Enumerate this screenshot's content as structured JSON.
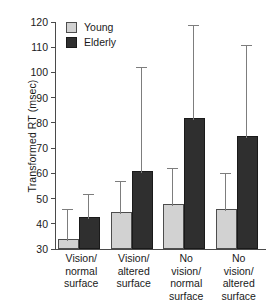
{
  "chart_data": {
    "type": "bar",
    "title": "",
    "xlabel": "",
    "ylabel": "Transformed RT (msec)",
    "ylim": [
      30,
      120
    ],
    "yticks": [
      30,
      40,
      50,
      60,
      70,
      80,
      90,
      100,
      110,
      120
    ],
    "grid": false,
    "legend_position": "top-left",
    "categories": [
      "Vision/ normal surface",
      "Vision/ altered surface",
      "No vision/ normal surface",
      "No vision/ altered surface"
    ],
    "category_lines": [
      [
        "Vision/",
        "normal",
        "surface"
      ],
      [
        "Vision/",
        "altered",
        "surface"
      ],
      [
        "No",
        "vision/",
        "normal",
        "surface"
      ],
      [
        "No",
        "vision/",
        "altered",
        "surface"
      ]
    ],
    "series": [
      {
        "name": "Young",
        "color": "#d2d2d2",
        "values": [
          33,
          44,
          47,
          45
        ],
        "errors_upper": [
          46,
          57,
          62,
          60
        ]
      },
      {
        "name": "Elderly",
        "color": "#2f2f2f",
        "values": [
          42,
          60,
          81,
          74
        ],
        "errors_upper": [
          52,
          102,
          119,
          111
        ]
      }
    ]
  },
  "legend": {
    "items": [
      {
        "label": "Young"
      },
      {
        "label": "Elderly"
      }
    ]
  },
  "axis": {
    "y_label": "Transformed RT (msec)",
    "y_min": 30,
    "y_max": 120,
    "tick_labels": [
      "120",
      "110",
      "100",
      "90",
      "80",
      "70",
      "60",
      "50",
      "40",
      "30"
    ]
  }
}
